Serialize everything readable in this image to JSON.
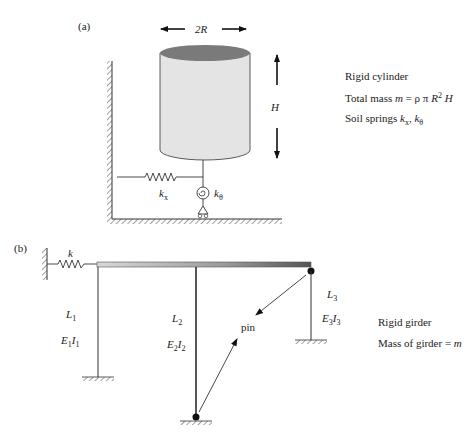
{
  "figure_a": {
    "panel_label": "(a)",
    "diameter_label": "2R",
    "height_label": "H",
    "spring_x_label": "k",
    "spring_x_sub": "x",
    "spring_theta_label": "k",
    "spring_theta_sub": "θ",
    "legend": [
      "Rigid cylinder",
      "Total mass m = ρ π R² H",
      "Soil springs kx, kθ"
    ],
    "legend_parts": {
      "line1": "Rigid cylinder",
      "line2_prefix": "Total mass ",
      "line2_m": "m",
      "line2_eq": " = ρ π ",
      "line2_R": "R",
      "line2_sup": "2",
      "line2_H": " H",
      "line3_prefix": "Soil springs ",
      "line3_k1": "k",
      "line3_sub1": "x",
      "line3_comma": ", ",
      "line3_k2": "k",
      "line3_sub2": "θ"
    },
    "colors": {
      "cylinder_top": "#7a7a7a",
      "cylinder_body": "#e4e4e4"
    }
  },
  "figure_b": {
    "panel_label": "(b)",
    "spring_label": "k",
    "column1": {
      "L": "L",
      "L_sub": "1",
      "E": "E",
      "E_sub": "1",
      "I": "I",
      "I_sub": "1"
    },
    "column2": {
      "L": "L",
      "L_sub": "2",
      "E": "E",
      "E_sub": "2",
      "I": "I",
      "I_sub": "2"
    },
    "column3": {
      "L": "L",
      "L_sub": "3",
      "E": "E",
      "E_sub": "3",
      "I": "I",
      "I_sub": "3"
    },
    "pin_label": "pin",
    "legend_line1": "Rigid girder",
    "legend_line2_prefix": "Mass of girder = ",
    "legend_line2_m": "m"
  }
}
